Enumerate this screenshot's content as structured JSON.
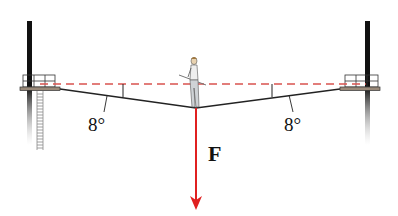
{
  "diagram": {
    "labels": {
      "left_angle": "8°",
      "right_angle": "8°",
      "force": "F"
    },
    "elements": {
      "left_pole": "pole-with-platform-and-ladder",
      "right_pole": "pole-with-platform",
      "horizontal_reference": "dashed-red-line",
      "rope": "sagging-rope",
      "walker": "tightrope-walker-with-balance-pole",
      "force_vector": "downward-red-arrow"
    },
    "colors": {
      "force_arrow": "#e02020",
      "dashed_line": "#d9534f",
      "rope": "#222222",
      "pole": "#111111",
      "platform": "#8a7a6a"
    },
    "angle_degrees": 8
  }
}
